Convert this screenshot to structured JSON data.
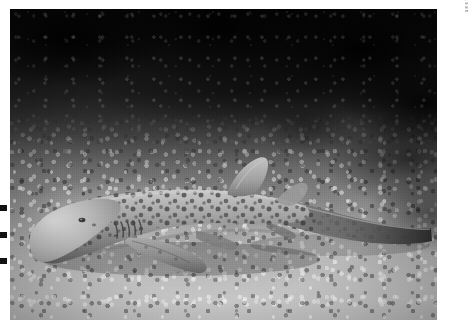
{
  "photo": {
    "subject": "zebra shark",
    "scene": "underwater coral reef seafloor",
    "treatment": "black and white",
    "credit_text": "ED ROBINSON / 1985",
    "border_color": "#ffffff",
    "plate": {
      "left": 10,
      "top": 9,
      "width": 427,
      "height": 311
    }
  },
  "elements": {
    "shark_label": "zebra shark resting on coral rubble",
    "reef_label": "dark coral reef background",
    "seafloor_label": "bright coral rubble seafloor",
    "dorsal_fin_label": "first dorsal fin",
    "second_dorsal_label": "second dorsal fin",
    "pectoral_fin_label": "pectoral fin",
    "tail_label": "elongated caudal fin",
    "eye_label": "eye",
    "gills_label": "gill slits",
    "spots_label": "leopard spot pattern"
  },
  "colors": {
    "deep_shadow": "#080808",
    "reef_dark": "#1d1d1d",
    "midtone": "#6d6d6d",
    "shark_body": "#9a9a9a",
    "sand_bright": "#c6c6c6",
    "border": "#ffffff",
    "credit_ink": "#4a4a4a"
  }
}
